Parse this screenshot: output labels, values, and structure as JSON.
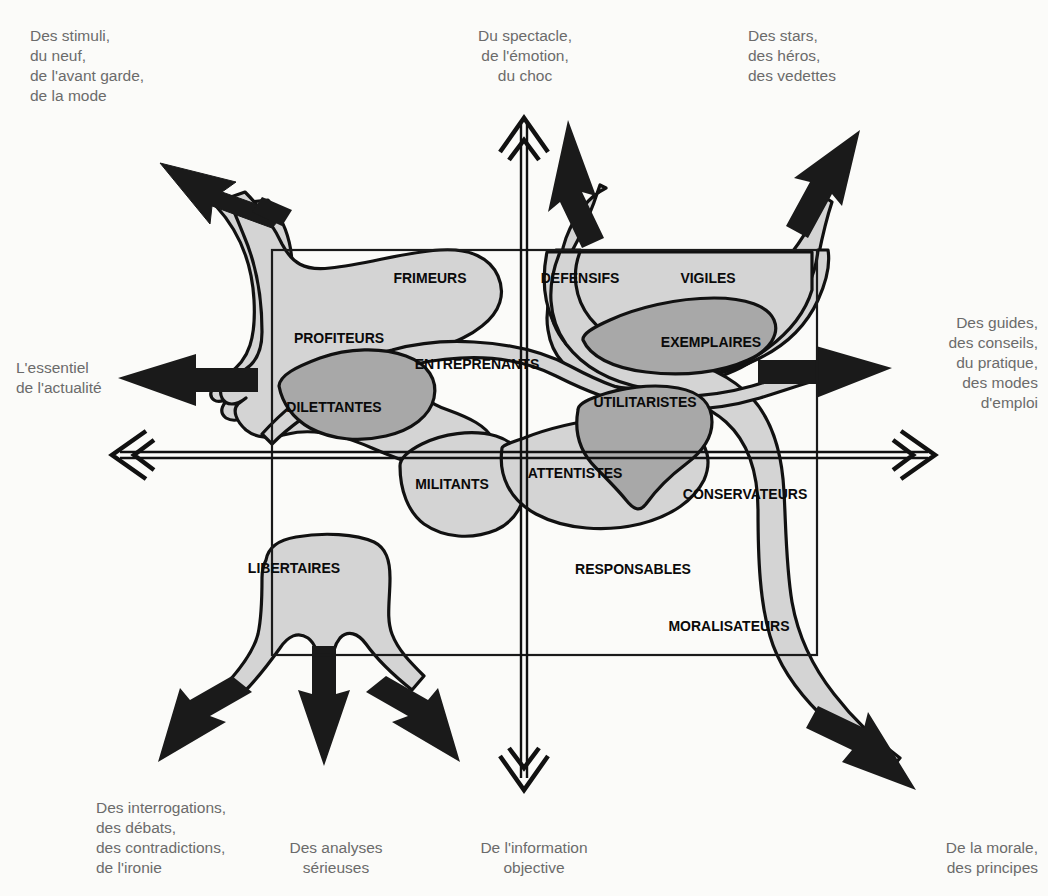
{
  "diagram": {
    "colors": {
      "background": "#fbfbf9",
      "light_blob": "#d4d4d4",
      "dark_blob": "#a8a8a8",
      "outline": "#111111",
      "axis": "#111111",
      "frame": "#1a1a1a",
      "axis_text": "#6b6b6b",
      "segment_text": "#0a0a0a"
    },
    "axes": {
      "vertical_top": "Du spectacle,\nde l'émotion,\ndu choc",
      "vertical_bottom": "De l'information\nobjective",
      "horizontal_left": "L'essentiel\nde l'actualité",
      "horizontal_right": "Des guides,\ndes conseils,\ndu pratique,\ndes modes\nd'emploi"
    },
    "corners": {
      "top_left": "Des stimuli,\ndu neuf,\nde l'avant garde,\nde la mode",
      "top_right": "Des stars,\ndes héros,\ndes vedettes",
      "bottom_left": "Des interrogations,\ndes débats,\ndes contradictions,\nde l'ironie",
      "bottom_center": "Des analyses\nsérieuses",
      "bottom_right": "De la morale,\ndes principes"
    },
    "segments": [
      {
        "id": "frimeurs",
        "label": "FRIMEURS",
        "x": 430,
        "y": 283,
        "anchor": "middle",
        "quadrant": "top-left",
        "shade": "light"
      },
      {
        "id": "profiteurs",
        "label": "PROFITEURS",
        "x": 339,
        "y": 343,
        "anchor": "middle",
        "quadrant": "top-left",
        "shade": "light"
      },
      {
        "id": "dilettantes",
        "label": "DILETTANTES",
        "x": 334,
        "y": 412,
        "anchor": "middle",
        "quadrant": "top-left",
        "shade": "dark"
      },
      {
        "id": "entreprenants",
        "label": "ENTREPRENANTS",
        "x": 477,
        "y": 369,
        "anchor": "middle",
        "quadrant": "top-centre",
        "shade": "light"
      },
      {
        "id": "defensifs",
        "label": "DEFENSIFS",
        "x": 580,
        "y": 283,
        "anchor": "middle",
        "quadrant": "top-right",
        "shade": "light"
      },
      {
        "id": "vigiles",
        "label": "VIGILES",
        "x": 708,
        "y": 283,
        "anchor": "middle",
        "quadrant": "top-right",
        "shade": "light"
      },
      {
        "id": "exemplaires",
        "label": "EXEMPLAIRES",
        "x": 711,
        "y": 347,
        "anchor": "middle",
        "quadrant": "top-right",
        "shade": "dark"
      },
      {
        "id": "utilitaristes",
        "label": "UTILITARISTES",
        "x": 645,
        "y": 407,
        "anchor": "middle",
        "quadrant": "top-right",
        "shade": "dark"
      },
      {
        "id": "militants",
        "label": "MILITANTS",
        "x": 452,
        "y": 489,
        "anchor": "middle",
        "quadrant": "bottom-left",
        "shade": "light"
      },
      {
        "id": "attentistes",
        "label": "ATTENTISTES",
        "x": 575,
        "y": 478,
        "anchor": "middle",
        "quadrant": "bottom-right",
        "shade": "light"
      },
      {
        "id": "conservateurs",
        "label": "CONSERVATEURS",
        "x": 745,
        "y": 499,
        "anchor": "middle",
        "quadrant": "bottom-right",
        "shade": "light"
      },
      {
        "id": "responsables",
        "label": "RESPONSABLES",
        "x": 633,
        "y": 574,
        "anchor": "middle",
        "quadrant": "bottom-right",
        "shade": "none"
      },
      {
        "id": "moralisateurs",
        "label": "MORALISATEURS",
        "x": 729,
        "y": 631,
        "anchor": "middle",
        "quadrant": "bottom-right",
        "shade": "light"
      },
      {
        "id": "libertaires",
        "label": "LIBERTAIRES",
        "x": 294,
        "y": 573,
        "anchor": "middle",
        "quadrant": "bottom-left",
        "shade": "light"
      }
    ],
    "frame": {
      "x": 272,
      "y": 250,
      "width": 545,
      "height": 405
    },
    "axis_geometry": {
      "vertical_x": 524,
      "horizontal_y": 455,
      "v_top": 118,
      "v_bottom": 790,
      "h_left": 112,
      "h_right": 935
    }
  }
}
